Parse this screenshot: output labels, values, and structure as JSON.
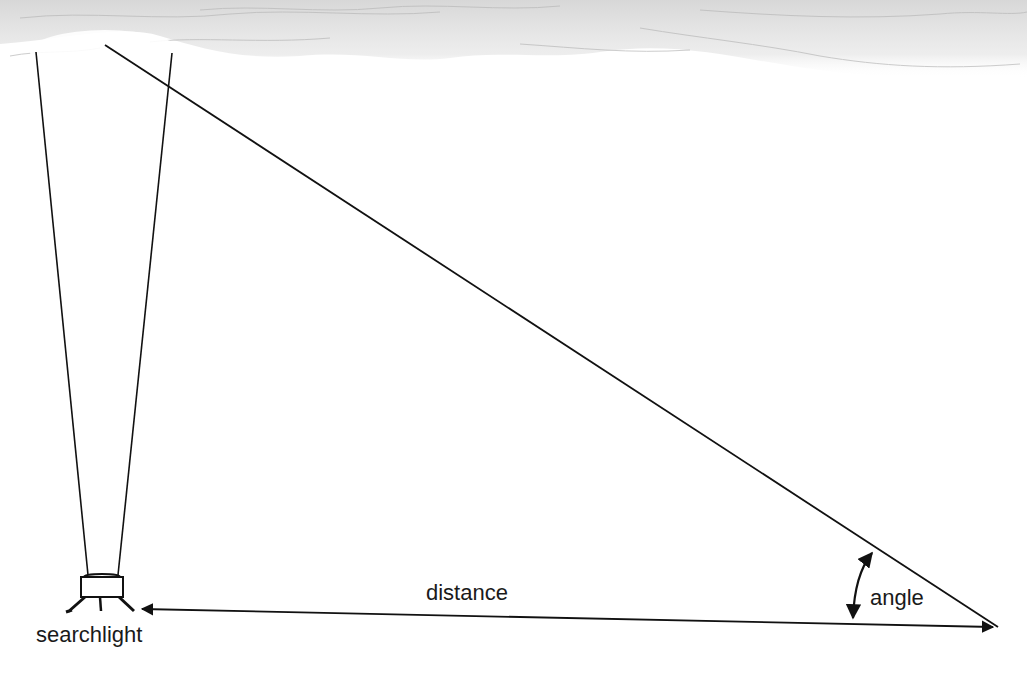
{
  "diagram": {
    "title": "",
    "labels": {
      "searchlight": "searchlight",
      "distance": "distance",
      "angle": "angle"
    },
    "elements": {
      "clouds": "cloud layer at top",
      "beam": "searchlight beam (two lines diverging upward)",
      "sight_line": "line of sight from observer to cloud spot",
      "baseline": "double-headed distance arrow between searchlight and observer",
      "angle_arrow": "curved double-headed arc marking the angle"
    },
    "colors": {
      "line": "#111111",
      "cloud": "#c8c8c8",
      "background": "#ffffff"
    }
  }
}
